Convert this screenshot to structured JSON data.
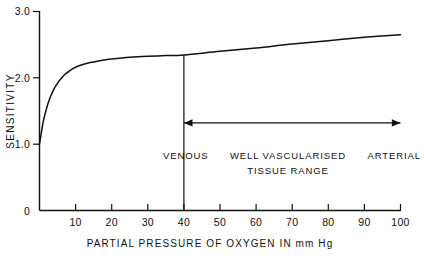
{
  "chart_data": {
    "type": "line",
    "title": "",
    "xlabel": "PARTIAL PRESSURE OF OXYGEN IN mm Hg",
    "ylabel": "SENSITIVITY",
    "xlim": [
      0,
      100
    ],
    "ylim": [
      0,
      3.0
    ],
    "grid": false,
    "legend": "none",
    "x_ticks": [
      10,
      20,
      30,
      40,
      50,
      60,
      70,
      80,
      90,
      100
    ],
    "x_tick_labels": [
      "10",
      "20",
      "30",
      "40",
      "50",
      "60",
      "70",
      "80",
      "90",
      "100"
    ],
    "y_ticks": [
      0,
      1.0,
      2.0,
      3.0
    ],
    "y_tick_labels": [
      "0",
      "1.0",
      "2.0",
      "3.0"
    ],
    "series": [
      {
        "name": "sensitivity",
        "x": [
          0,
          1,
          2,
          3,
          4,
          5,
          6,
          7,
          8,
          9,
          10,
          12,
          14,
          16,
          18,
          20,
          25,
          30,
          35,
          40,
          50,
          60,
          70,
          80,
          90,
          100
        ],
        "values": [
          1.0,
          1.33,
          1.55,
          1.71,
          1.83,
          1.92,
          1.99,
          2.05,
          2.09,
          2.13,
          2.16,
          2.2,
          2.23,
          2.25,
          2.27,
          2.285,
          2.31,
          2.325,
          2.335,
          2.345,
          2.4,
          2.45,
          2.51,
          2.56,
          2.61,
          2.65
        ]
      }
    ],
    "markers": [
      {
        "name": "venous-marker",
        "type": "vertical-line",
        "x": 40,
        "y_from": 0,
        "y_to": 2.345
      }
    ],
    "annotations": {
      "range_arrow": {
        "name": "tissue-range-arrow",
        "type": "double-arrow",
        "x_start": 40,
        "x_end": 100,
        "y": 1.32
      },
      "left_label": "VENOUS",
      "right_label": "ARTERIAL",
      "center_label_line1": "WELL VASCULARISED",
      "center_label_line2": "TISSUE RANGE"
    },
    "colors": {
      "ink": "#111111",
      "background": "#ffffff"
    }
  }
}
